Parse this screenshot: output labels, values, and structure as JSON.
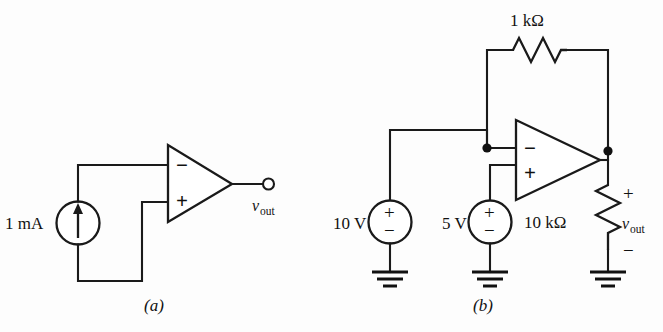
{
  "figure": {
    "background_color": "#fdfdfd",
    "line_color": "#1a1a1a",
    "width": 663,
    "height": 332
  },
  "circuit_a": {
    "caption": "(a)",
    "source_label": "1 mA",
    "source_type": "current-source",
    "source_direction": "up",
    "opamp": {
      "inverting_pin": "−",
      "noninverting_pin": "+",
      "inverting_input_connection": "current-source-top",
      "noninverting_input_connection": "current-source-bottom"
    },
    "output_label_var": "v",
    "output_label_sub": "out",
    "output_terminal": "open-circle"
  },
  "circuit_b": {
    "caption": "(b)",
    "feedback_resistor": "1 kΩ",
    "load_resistor": "10 kΩ",
    "source_left": "10 V",
    "source_right": "5 V",
    "source_polarity_top": "+",
    "source_polarity_bottom": "−",
    "opamp": {
      "inverting_pin": "−",
      "noninverting_pin": "+"
    },
    "output_label_var": "v",
    "output_label_sub": "out",
    "output_polarity_top": "+",
    "output_polarity_bottom": "−",
    "ground_count": 3
  }
}
